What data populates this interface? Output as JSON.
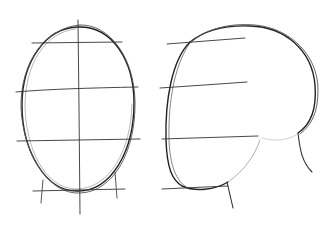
{
  "image": {
    "description": "Pencil sketch of two head construction drawings: front-view oval with guide lines, and side-view profile head with guide lines",
    "colors": {
      "background": "#ffffff",
      "pencil_dark": "#1a1a1a",
      "pencil_mid": "#4a4a4a",
      "pencil_light": "#9a9a9a"
    }
  },
  "figures": [
    {
      "name": "front-view-head",
      "guide_lines": [
        "top",
        "brow",
        "nose",
        "chin"
      ]
    },
    {
      "name": "side-view-head",
      "guide_lines": [
        "top",
        "brow",
        "nose",
        "chin"
      ]
    }
  ]
}
